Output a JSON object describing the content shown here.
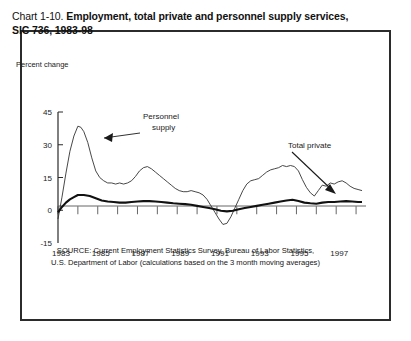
{
  "figure": {
    "title_prefix": "Chart 1-10. ",
    "title_main": "Employment, total private and personnel supply services, SIC 736, 1983-98",
    "source_line_1": "SOURCE: Current Employment Statistics Survey, Bureau of Labor Statistics,",
    "source_line_2": "U.S. Department of Labor (calculations based on the 3 month moving averages)",
    "frame_color": "#2b2b2b",
    "background_color": "#ffffff"
  },
  "chart_data": {
    "type": "line",
    "title": "Chart 1-10. Employment, total private and personnel supply services, SIC 736, 1983-98",
    "xlabel": "",
    "ylabel": "Percent change",
    "ylim": [
      -15,
      45
    ],
    "xlim": [
      1983,
      1998.5
    ],
    "yticks": [
      "45",
      "30",
      "15",
      "0",
      "-15"
    ],
    "ytick_values": [
      45,
      30,
      15,
      0,
      -15
    ],
    "xticks": [
      "1983",
      "1985",
      "1987",
      "1989",
      "1991",
      "1993",
      "1995",
      "1997"
    ],
    "xtick_values": [
      1983,
      1985,
      1987,
      1989,
      1991,
      1993,
      1995,
      1997
    ],
    "minor_tick_years": [
      1984,
      1986,
      1988,
      1990,
      1992,
      1994,
      1996,
      1998
    ],
    "grid": false,
    "legend_position": "annotations-in-plot",
    "annotations": [
      {
        "label_line_1": "Personnel",
        "label_line_2": "supply",
        "name": "personnel-supply-annotation",
        "points_to_series": "Personnel supply"
      },
      {
        "label_line_1": "Total private",
        "label_line_2": "",
        "name": "total-private-annotation",
        "points_to_series": "Total private"
      }
    ],
    "series": [
      {
        "name": "Personnel supply",
        "style": "thin",
        "color": "#333333",
        "x": [
          1983.0,
          1983.2,
          1983.4,
          1983.6,
          1983.8,
          1984.0,
          1984.15,
          1984.3,
          1984.5,
          1984.7,
          1984.9,
          1985.1,
          1985.3,
          1985.5,
          1985.7,
          1985.9,
          1986.1,
          1986.3,
          1986.5,
          1986.7,
          1986.9,
          1987.1,
          1987.3,
          1987.5,
          1987.7,
          1987.9,
          1988.1,
          1988.3,
          1988.5,
          1988.7,
          1988.9,
          1989.1,
          1989.3,
          1989.5,
          1989.7,
          1989.9,
          1990.1,
          1990.3,
          1990.5,
          1990.7,
          1990.9,
          1991.1,
          1991.3,
          1991.5,
          1991.7,
          1991.9,
          1992.1,
          1992.3,
          1992.5,
          1992.7,
          1992.9,
          1993.1,
          1993.3,
          1993.5,
          1993.7,
          1993.9,
          1994.1,
          1994.3,
          1994.5,
          1994.7,
          1994.9,
          1995.1,
          1995.3,
          1995.5,
          1995.7,
          1995.9,
          1996.1,
          1996.3,
          1996.5,
          1996.7,
          1996.9,
          1997.1,
          1997.3,
          1997.5,
          1997.7,
          1997.9,
          1998.1,
          1998.3
        ],
        "y": [
          -4.0,
          6.0,
          17.0,
          27.0,
          34.0,
          38.5,
          38.0,
          36.0,
          31.0,
          24.0,
          18.0,
          15.0,
          13.5,
          12.5,
          12.5,
          12.0,
          12.5,
          12.0,
          12.5,
          13.5,
          15.5,
          18.0,
          19.5,
          20.0,
          19.0,
          17.5,
          16.0,
          14.5,
          13.0,
          11.5,
          10.0,
          9.0,
          8.5,
          8.5,
          9.0,
          8.5,
          8.0,
          7.0,
          5.0,
          2.0,
          -1.0,
          -4.0,
          -6.5,
          -6.0,
          -3.0,
          1.0,
          5.0,
          9.0,
          12.0,
          13.5,
          14.0,
          14.5,
          16.0,
          17.5,
          18.5,
          19.0,
          19.5,
          20.5,
          20.0,
          20.5,
          20.0,
          18.0,
          14.0,
          10.5,
          8.0,
          6.5,
          9.0,
          11.5,
          11.0,
          12.5,
          12.0,
          13.0,
          13.5,
          12.5,
          11.0,
          10.0,
          9.5,
          9.0
        ]
      },
      {
        "name": "Total private",
        "style": "thick",
        "color": "#111111",
        "x": [
          1983.0,
          1983.2,
          1983.4,
          1983.6,
          1983.8,
          1984.0,
          1984.3,
          1984.6,
          1984.9,
          1985.2,
          1985.5,
          1985.8,
          1986.1,
          1986.4,
          1986.7,
          1987.0,
          1987.3,
          1987.6,
          1987.9,
          1988.2,
          1988.5,
          1988.8,
          1989.1,
          1989.4,
          1989.7,
          1990.0,
          1990.3,
          1990.6,
          1990.9,
          1991.2,
          1991.5,
          1991.8,
          1992.1,
          1992.4,
          1992.7,
          1993.0,
          1993.3,
          1993.6,
          1993.9,
          1994.2,
          1994.5,
          1994.8,
          1995.1,
          1995.4,
          1995.7,
          1996.0,
          1996.3,
          1996.6,
          1996.9,
          1997.2,
          1997.5,
          1997.8,
          1998.1,
          1998.3
        ],
        "y": [
          -1.0,
          1.5,
          3.5,
          5.0,
          6.0,
          7.0,
          7.0,
          6.5,
          5.5,
          4.5,
          4.0,
          3.8,
          3.5,
          3.5,
          3.8,
          4.0,
          4.2,
          4.2,
          4.0,
          3.8,
          3.5,
          3.2,
          3.0,
          2.8,
          2.5,
          2.0,
          1.5,
          1.0,
          0.5,
          -0.2,
          -0.5,
          -0.2,
          0.5,
          1.0,
          1.5,
          2.0,
          2.5,
          3.0,
          3.5,
          4.0,
          4.5,
          4.8,
          4.2,
          3.5,
          3.2,
          3.0,
          3.5,
          3.8,
          3.8,
          4.0,
          4.2,
          4.0,
          3.8,
          3.8
        ]
      }
    ]
  }
}
